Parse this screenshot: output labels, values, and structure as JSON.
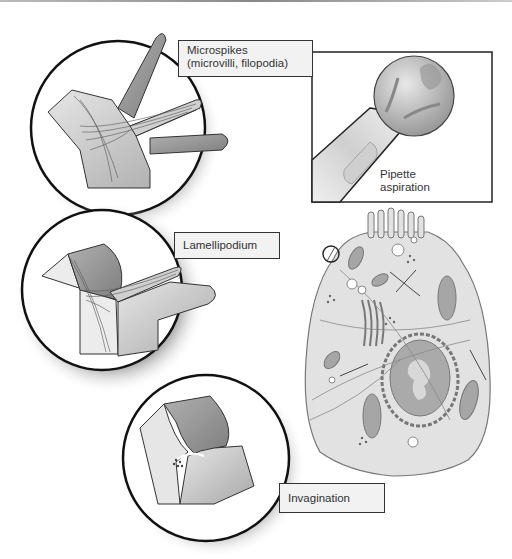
{
  "diagram": {
    "labels": {
      "microspikes_line1": "Microspikes",
      "microspikes_line2": "(microvilli, filopodia)",
      "pipette_line1": "Pipette",
      "pipette_line2": "aspiration",
      "lamellipodium": "Lamellipodium",
      "invagination": "Invagination"
    },
    "panels": [
      {
        "id": "microspikes",
        "shape": "circle"
      },
      {
        "id": "lamellipodium",
        "shape": "circle"
      },
      {
        "id": "invagination",
        "shape": "circle"
      },
      {
        "id": "pipette-aspiration",
        "shape": "square"
      },
      {
        "id": "whole-cell",
        "shape": "cell"
      }
    ],
    "colors": {
      "outline": "#222222",
      "membrane_light": "#d8d8d8",
      "membrane_dark": "#9a9a9a",
      "cell_fill": "#e2e2e2",
      "label_bg": "#f2f2f2"
    }
  }
}
